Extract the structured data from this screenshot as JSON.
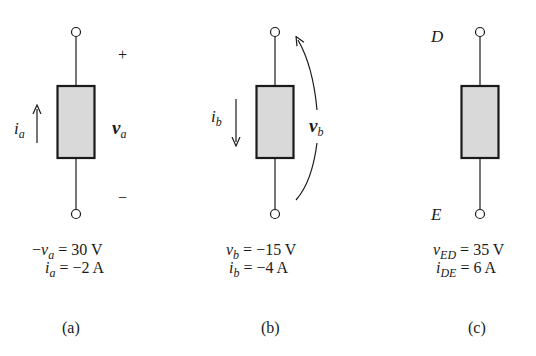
{
  "figure": {
    "panels": [
      {
        "id": "a",
        "caption": "(a)",
        "current_label": {
          "base": "i",
          "sub": "a"
        },
        "current_arrow_direction": "up",
        "voltage_label": {
          "base": "v",
          "sub": "a"
        },
        "polarity": {
          "plus": "+",
          "minus": "−"
        },
        "equations": [
          {
            "prefix": "−",
            "base": "v",
            "sub": "a",
            "rhs": " = 30 V"
          },
          {
            "prefix": "",
            "base": "i",
            "sub": "a",
            "rhs": " = −2 A"
          }
        ]
      },
      {
        "id": "b",
        "caption": "(b)",
        "current_label": {
          "base": "i",
          "sub": "b"
        },
        "current_arrow_direction": "down",
        "voltage_label": {
          "base": "v",
          "sub": "b"
        },
        "voltage_arrow": "curved arrow from bottom terminal to top terminal",
        "equations": [
          {
            "prefix": "",
            "base": "v",
            "sub": "b",
            "rhs": " = −15 V"
          },
          {
            "prefix": "",
            "base": "i",
            "sub": "b",
            "rhs": " = −4 A"
          }
        ]
      },
      {
        "id": "c",
        "caption": "(c)",
        "terminals": {
          "top": "D",
          "bottom": "E"
        },
        "equations": [
          {
            "prefix": "",
            "base": "v",
            "sub": "ED",
            "rhs": " = 35 V"
          },
          {
            "prefix": "",
            "base": "i",
            "sub": "DE",
            "rhs": " = 6 A"
          }
        ]
      }
    ]
  },
  "colors": {
    "element_fill": "#d9d9d9",
    "stroke": "#1a1a1a",
    "background": "#ffffff"
  }
}
